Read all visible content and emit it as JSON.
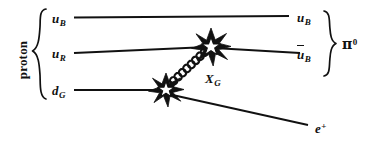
{
  "figure": {
    "type": "feynman-diagram",
    "background_color": "#ffffff",
    "ink_color": "#111111",
    "width": 367,
    "height": 145
  },
  "left_group": {
    "label": "proton",
    "brace": "{",
    "constituents": [
      {
        "symbol": "u",
        "subscript": "B"
      },
      {
        "symbol": "u",
        "subscript": "R"
      },
      {
        "symbol": "d",
        "subscript": "G"
      }
    ]
  },
  "right_group": {
    "brace": "}",
    "label_symbol": "π",
    "label_superscript": "0",
    "products": [
      {
        "symbol": "u",
        "subscript": "B",
        "bar": false
      },
      {
        "symbol": "u",
        "subscript": "B",
        "bar": true
      }
    ]
  },
  "propagator": {
    "symbol": "X",
    "subscript": "G",
    "style": "coil"
  },
  "lepton": {
    "symbol": "e",
    "superscript": "+"
  },
  "vertices": [
    {
      "name": "upper-vertex",
      "x": 210,
      "y": 47,
      "glyph": "starburst"
    },
    {
      "name": "lower-vertex",
      "x": 165,
      "y": 90,
      "glyph": "starburst"
    }
  ],
  "lines": [
    {
      "name": "u-B-spectator",
      "direction": "right"
    },
    {
      "name": "u-R-incoming",
      "direction": "right"
    },
    {
      "name": "u-bar-B-outgoing",
      "direction": "left"
    },
    {
      "name": "d-G-incoming",
      "direction": "right"
    },
    {
      "name": "e-plus-outgoing",
      "direction": "left"
    }
  ]
}
